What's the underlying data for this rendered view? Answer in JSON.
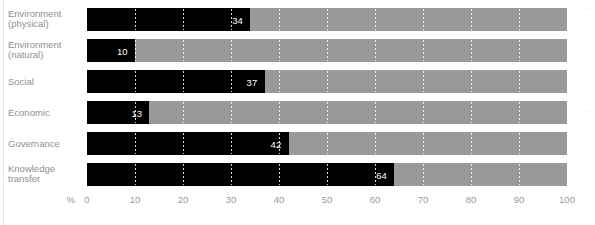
{
  "chart_data": {
    "type": "bar",
    "orientation": "horizontal",
    "title": "",
    "xlabel": "%",
    "ylabel": "",
    "xlim": [
      0,
      100
    ],
    "xticks": [
      0,
      10,
      20,
      30,
      40,
      50,
      60,
      70,
      80,
      90,
      100
    ],
    "xtick_labels": [
      "0",
      "10",
      "20",
      "30",
      "40",
      "50",
      "60",
      "70",
      "80",
      "90",
      "100"
    ],
    "grid": true,
    "legend": null,
    "max_value": 100,
    "categories": [
      "Environment (physical)",
      "Environment (natural)",
      "Social",
      "Economic",
      "Governance",
      "Knowledge transfer"
    ],
    "values": [
      34,
      10,
      37,
      13,
      42,
      64
    ],
    "value_labels": [
      "34",
      "10",
      "37",
      "13",
      "42",
      "64"
    ],
    "series": [
      {
        "name": "value",
        "values": [
          34,
          10,
          37,
          13,
          42,
          64
        ],
        "color": "#000000"
      },
      {
        "name": "remainder",
        "values": [
          66,
          90,
          63,
          87,
          58,
          36
        ],
        "color": "#999999"
      }
    ]
  },
  "axis": {
    "unit_label": "%",
    "ticks": [
      {
        "label": "0",
        "value": 0
      },
      {
        "label": "10",
        "value": 10
      },
      {
        "label": "20",
        "value": 20
      },
      {
        "label": "30",
        "value": 30
      },
      {
        "label": "40",
        "value": 40
      },
      {
        "label": "50",
        "value": 50
      },
      {
        "label": "60",
        "value": 60
      },
      {
        "label": "70",
        "value": 70
      },
      {
        "label": "80",
        "value": 80
      },
      {
        "label": "90",
        "value": 90
      },
      {
        "label": "100",
        "value": 100
      }
    ]
  },
  "rows": [
    {
      "label_line1": "Environment",
      "label_line2": "(physical)",
      "value": 34,
      "value_label": "34"
    },
    {
      "label_line1": "Environment",
      "label_line2": "(natural)",
      "value": 10,
      "value_label": "10"
    },
    {
      "label_line1": "Social",
      "label_line2": "",
      "value": 37,
      "value_label": "37"
    },
    {
      "label_line1": "Economic",
      "label_line2": "",
      "value": 13,
      "value_label": "13"
    },
    {
      "label_line1": "Governance",
      "label_line2": "",
      "value": 42,
      "value_label": "42"
    },
    {
      "label_line1": "Knowledge",
      "label_line2": "transfer",
      "value": 64,
      "value_label": "64"
    }
  ],
  "colors": {
    "bar_fill": "#000000",
    "bar_track": "#999999",
    "gridline": "#ffffff",
    "text": "#9a9a9a",
    "value_text": "#ffffff",
    "background": "#ffffff"
  }
}
